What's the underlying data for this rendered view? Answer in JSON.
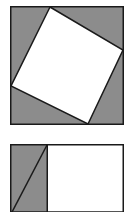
{
  "page": {
    "width": 134,
    "height": 212,
    "background_color": "#ffffff"
  },
  "colors": {
    "gray_fill": "#8c8c8c",
    "white_fill": "#ffffff",
    "stroke": "#1a1a1a",
    "background": "#ffffff"
  },
  "figures": [
    {
      "id": "inscribed-square",
      "name": "Tilted square inscribed in outer square",
      "outer_square": {
        "x": 10,
        "y": 6,
        "width": 114,
        "height": 119,
        "fill": "#8c8c8c",
        "stroke": "#1a1a1a",
        "stroke_width": 1.5
      },
      "inner_square": {
        "fill": "#ffffff",
        "stroke": "#1a1a1a",
        "stroke_width": 1.5,
        "vertices": [
          {
            "label": "top",
            "x": 50,
            "y": 7
          },
          {
            "label": "right",
            "x": 123,
            "y": 50
          },
          {
            "label": "bottom",
            "x": 88,
            "y": 124
          },
          {
            "label": "left",
            "x": 11,
            "y": 86
          }
        ]
      }
    },
    {
      "id": "split-square",
      "name": "Square split into gray left band and white right region with diagonal",
      "outer_square": {
        "x": 10,
        "y": 144,
        "width": 114,
        "height": 68,
        "fill": "#ffffff",
        "stroke": "#1a1a1a",
        "stroke_width": 1.5
      },
      "gray_band": {
        "x": 10,
        "y": 144,
        "width": 38,
        "height": 68,
        "fill": "#8c8c8c",
        "stroke": "#1a1a1a",
        "stroke_width": 1.5
      },
      "diagonal": {
        "x1": 47,
        "y1": 145,
        "x2": 11,
        "y2": 214,
        "stroke": "#1a1a1a",
        "stroke_width": 1.5
      },
      "clipped_at_bottom": true
    }
  ]
}
